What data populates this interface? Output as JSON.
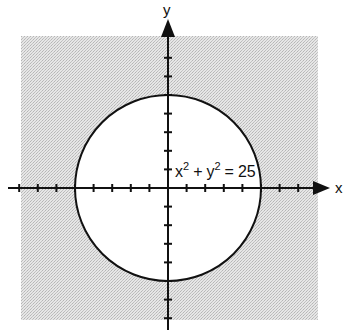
{
  "figure": {
    "title": "",
    "x_axis_label": "x",
    "y_axis_label": "y",
    "equation": {
      "base1": "x",
      "exp1": "2",
      "op": "+",
      "base2": "y",
      "exp2": "2",
      "equals": "=",
      "rhs": "25"
    },
    "circle": {
      "center": [
        0,
        0
      ],
      "radius": 5
    },
    "shaded_region": "outside circle (x^2 + y^2 > 25), within square window",
    "tick_range": {
      "x": [
        -8,
        8
      ],
      "y": [
        -8,
        8
      ]
    },
    "colors": {
      "shade": "#d9d9d9",
      "ink": "#111111",
      "background": "#ffffff"
    }
  }
}
